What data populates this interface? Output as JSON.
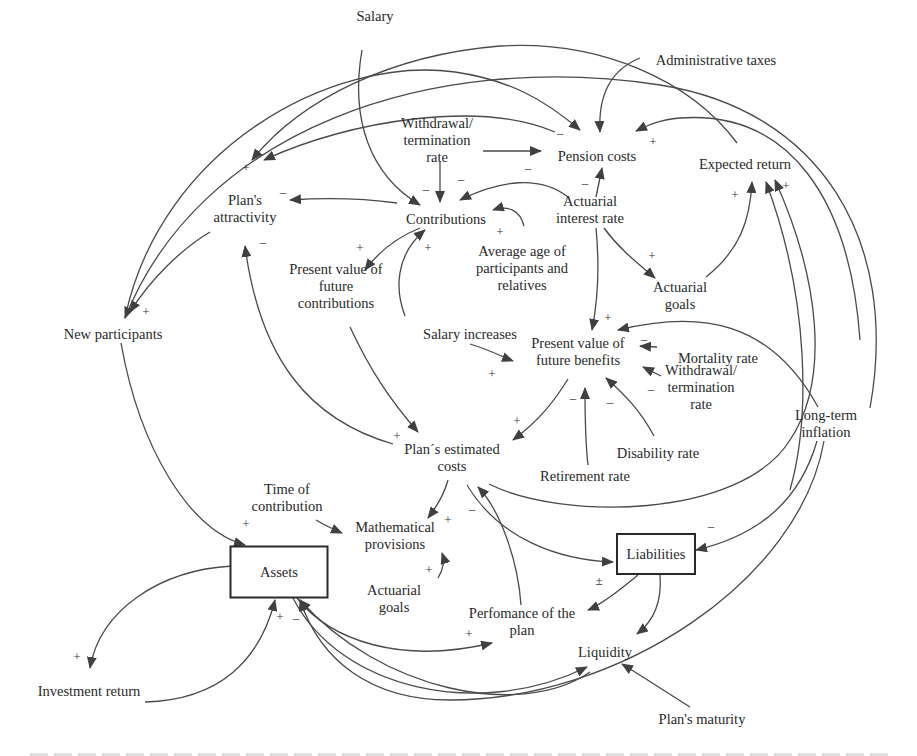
{
  "diagram": {
    "type": "causal-loop-diagram",
    "nodes": [
      {
        "id": "salary",
        "lines": [
          "Salary"
        ],
        "x": 375,
        "y": 16,
        "stock": false
      },
      {
        "id": "admin_taxes",
        "lines": [
          "Administrative taxes"
        ],
        "x": 716,
        "y": 60,
        "stock": false
      },
      {
        "id": "withdrawal_top",
        "lines": [
          "Withdrawal/",
          "termination",
          "rate"
        ],
        "x": 437,
        "y": 140,
        "stock": false
      },
      {
        "id": "pension_costs",
        "lines": [
          "Pension costs"
        ],
        "x": 597,
        "y": 156,
        "stock": false
      },
      {
        "id": "expected_return",
        "lines": [
          "Expected return"
        ],
        "x": 745,
        "y": 164,
        "stock": false
      },
      {
        "id": "plans_attractivity",
        "lines": [
          "Plan's",
          "attractivity"
        ],
        "x": 245,
        "y": 208,
        "stock": false
      },
      {
        "id": "contributions",
        "lines": [
          "Contributions"
        ],
        "x": 446,
        "y": 219,
        "stock": false
      },
      {
        "id": "actuarial_interest",
        "lines": [
          "Actuarial",
          "interest rate"
        ],
        "x": 590,
        "y": 209,
        "stock": false
      },
      {
        "id": "avg_age",
        "lines": [
          "Average age of",
          "participants and",
          "relatives"
        ],
        "x": 522,
        "y": 268,
        "stock": false
      },
      {
        "id": "actuarial_goals_top",
        "lines": [
          "Actuarial",
          "goals"
        ],
        "x": 680,
        "y": 295,
        "stock": false
      },
      {
        "id": "pv_future_contrib",
        "lines": [
          "Present value of",
          "future",
          "contributions"
        ],
        "x": 336,
        "y": 286,
        "stock": false
      },
      {
        "id": "new_participants",
        "lines": [
          "New participants"
        ],
        "x": 113,
        "y": 334,
        "stock": false
      },
      {
        "id": "salary_increases",
        "lines": [
          "Salary increases"
        ],
        "x": 470,
        "y": 334,
        "stock": false
      },
      {
        "id": "pv_future_benefits",
        "lines": [
          "Present value of",
          "future benefits"
        ],
        "x": 578,
        "y": 351,
        "stock": false
      },
      {
        "id": "mortality_rate",
        "lines": [
          "Mortality rate"
        ],
        "x": 718,
        "y": 358,
        "stock": false
      },
      {
        "id": "withdrawal_right",
        "lines": [
          "Withdrawal/",
          "termination",
          "rate"
        ],
        "x": 701,
        "y": 387,
        "stock": false
      },
      {
        "id": "long_term_inflation",
        "lines": [
          "Long-term",
          "inflation"
        ],
        "x": 826,
        "y": 423,
        "stock": false
      },
      {
        "id": "disability_rate",
        "lines": [
          "Disability rate"
        ],
        "x": 658,
        "y": 453,
        "stock": false
      },
      {
        "id": "plans_estimated_costs",
        "lines": [
          "Plan´s estimated",
          "costs"
        ],
        "x": 452,
        "y": 457,
        "stock": false
      },
      {
        "id": "retirement_rate",
        "lines": [
          "Retirement rate"
        ],
        "x": 585,
        "y": 476,
        "stock": false
      },
      {
        "id": "time_of_contribution",
        "lines": [
          "Time of",
          "contribution"
        ],
        "x": 287,
        "y": 497,
        "stock": false
      },
      {
        "id": "math_provisions",
        "lines": [
          "Mathematical",
          "provisions"
        ],
        "x": 395,
        "y": 535,
        "stock": false
      },
      {
        "id": "assets",
        "lines": [
          "Assets"
        ],
        "x": 279,
        "y": 572,
        "stock": true,
        "w": 97,
        "h": 51
      },
      {
        "id": "liabilities",
        "lines": [
          "Liabilities"
        ],
        "x": 656,
        "y": 554,
        "stock": true,
        "w": 78,
        "h": 40
      },
      {
        "id": "actuarial_goals_bottom",
        "lines": [
          "Actuarial",
          "goals"
        ],
        "x": 394,
        "y": 598,
        "stock": false
      },
      {
        "id": "performance_plan",
        "lines": [
          "Perfomance of the",
          "plan"
        ],
        "x": 522,
        "y": 621,
        "stock": false
      },
      {
        "id": "liquidity",
        "lines": [
          "Liquidity"
        ],
        "x": 605,
        "y": 652,
        "stock": false
      },
      {
        "id": "investment_return",
        "lines": [
          "Investment return"
        ],
        "x": 89,
        "y": 691,
        "stock": false
      },
      {
        "id": "plans_maturity",
        "lines": [
          "Plan's maturity"
        ],
        "x": 702,
        "y": 719,
        "stock": false
      }
    ],
    "edges": [
      {
        "from": "salary",
        "to": "contributions",
        "path": "M362 50 C350 120 370 175 420 205",
        "pol": "",
        "px": 0,
        "py": 0
      },
      {
        "from": "admin_taxes",
        "to": "pension_costs",
        "path": "M640 58 C610 70 598 95 600 132",
        "pol": "",
        "px": 0,
        "py": 0
      },
      {
        "from": "withdrawal_top",
        "to": "pension_costs",
        "path": "M483 151 L541 151",
        "pol": "–",
        "px": 528,
        "py": 172
      },
      {
        "from": "withdrawal_top",
        "to": "contributions",
        "path": "M440 162 L440 202",
        "pol": "–",
        "px": 426,
        "py": 193
      },
      {
        "from": "actuarial_interest",
        "to": "pension_costs",
        "path": "M596 197 L602 168",
        "pol": "–",
        "px": 585,
        "py": 187
      },
      {
        "from": "expected_return",
        "to": "pension_costs",
        "path": "M860 340 C850 200 790 110 680 118 C660 120 650 124 636 131",
        "pol": "+",
        "px": 653,
        "py": 146
      },
      {
        "from": "new_participants",
        "to": "pension_costs",
        "path": "M125 318 C160 150 330 55 455 72 C510 80 545 100 580 130",
        "pol": "–",
        "px": 560,
        "py": 137
      },
      {
        "from": "pension_costs",
        "to": "plans_attractivity",
        "path": "M555 132 C480 100 350 120 264 160",
        "pol": "",
        "px": 0,
        "py": 0
      },
      {
        "from": "expected_return",
        "to": "plans_attractivity",
        "path": "M737 143 C690 80 600 40 500 46 C390 55 300 100 252 160",
        "pol": "+",
        "px": 246,
        "py": 172
      },
      {
        "from": "contributions",
        "to": "plans_attractivity",
        "path": "M397 203 C360 198 320 198 290 200",
        "pol": "–",
        "px": 283,
        "py": 196
      },
      {
        "from": "actuarial_interest",
        "to": "contributions",
        "path": "M568 197 C540 175 500 180 460 200",
        "pol": "–",
        "px": 461,
        "py": 183
      },
      {
        "from": "avg_age",
        "to": "contributions",
        "path": "M524 226 C520 210 508 205 493 210",
        "pol": "+",
        "px": 500,
        "py": 236
      },
      {
        "from": "contributions",
        "to": "pv_future_contrib",
        "path": "M420 228 C400 236 380 250 365 270",
        "pol": "+",
        "px": 360,
        "py": 252
      },
      {
        "from": "salary_increases",
        "to": "contributions",
        "path": "M405 316 C395 290 395 255 425 230",
        "pol": "+",
        "px": 428,
        "py": 252
      },
      {
        "from": "plans_attractivity",
        "to": "new_participants",
        "path": "M210 232 C180 250 150 280 130 312",
        "pol": "+",
        "px": 146,
        "py": 316
      },
      {
        "from": "actuarial_interest",
        "to": "actuarial_goals_top",
        "path": "M604 228 C620 250 640 265 655 278",
        "pol": "+",
        "px": 652,
        "py": 260
      },
      {
        "from": "actuarial_interest",
        "to": "pv_future_benefits",
        "path": "M596 228 C600 270 598 300 592 330",
        "pol": "",
        "px": 0,
        "py": 0
      },
      {
        "from": "actuarial_goals_top",
        "to": "expected_return",
        "path": "M706 277 C740 250 750 220 752 182",
        "pol": "+",
        "px": 735,
        "py": 199
      },
      {
        "from": "long_term_inflation",
        "to": "expected_return",
        "path": "M790 490 C810 420 810 300 766 182",
        "pol": "+",
        "px": 786,
        "py": 190
      },
      {
        "from": "salary_increases",
        "to": "pv_future_benefits",
        "path": "M470 344 C490 350 505 358 513 361",
        "pol": "+",
        "px": 492,
        "py": 378
      },
      {
        "from": "long_term_inflation",
        "to": "pv_future_benefits",
        "path": "M818 407 C770 320 700 310 618 330",
        "pol": "+",
        "px": 608,
        "py": 322
      },
      {
        "from": "mortality_rate",
        "to": "pv_future_benefits",
        "path": "M657 347 L640 346",
        "pol": "–",
        "px": 644,
        "py": 343
      },
      {
        "from": "withdrawal_right",
        "to": "pv_future_benefits",
        "path": "M661 376 L643 367",
        "pol": "–",
        "px": 651,
        "py": 393
      },
      {
        "from": "disability_rate",
        "to": "pv_future_benefits",
        "path": "M654 436 C640 410 625 395 606 378",
        "pol": "–",
        "px": 610,
        "py": 406
      },
      {
        "from": "retirement_rate",
        "to": "pv_future_benefits",
        "path": "M588 465 C585 440 585 410 585 388",
        "pol": "–",
        "px": 573,
        "py": 402
      },
      {
        "from": "pv_future_benefits",
        "to": "plans_estimated_costs",
        "path": "M568 379 C555 400 540 420 513 440",
        "pol": "+",
        "px": 517,
        "py": 425
      },
      {
        "from": "pv_future_contrib",
        "to": "plans_estimated_costs",
        "path": "M350 327 C370 370 390 400 418 432",
        "pol": "",
        "px": 0,
        "py": 0
      },
      {
        "from": "plans_estimated_costs",
        "to": "plans_attractivity",
        "path": "M393 444 C310 420 260 360 245 246",
        "pol": "+",
        "px": 397,
        "py": 440
      },
      {
        "from": "plans_attractivity_neg",
        "to": "plans_attractivity",
        "path": "",
        "pol": "–",
        "px": 263,
        "py": 246
      },
      {
        "from": "plans_estimated_costs",
        "to": "math_provisions",
        "path": "M448 480 C444 495 438 505 428 518",
        "pol": "+",
        "px": 448,
        "py": 524
      },
      {
        "from": "time_of_contribution",
        "to": "math_provisions",
        "path": "M316 520 C326 526 335 530 342 533",
        "pol": "",
        "px": 0,
        "py": 0
      },
      {
        "from": "actuarial_goals_bottom",
        "to": "math_provisions",
        "path": "M438 578 C443 570 445 562 442 553",
        "pol": "+",
        "px": 429,
        "py": 574
      },
      {
        "from": "plans_estimated_costs",
        "to": "liabilities",
        "path": "M467 485 C500 540 560 560 613 562",
        "pol": "",
        "px": 0,
        "py": 0
      },
      {
        "from": "performance_plan",
        "to": "plans_estimated_costs",
        "path": "M521 605 C518 560 500 510 478 487",
        "pol": "–",
        "px": 472,
        "py": 513
      },
      {
        "from": "plans_estimated_costs",
        "to": "expected_return",
        "path": "M489 484 C560 520 740 520 790 440 C830 380 820 280 775 180",
        "pol": "",
        "px": 0,
        "py": 0
      },
      {
        "from": "long_term_inflation",
        "to": "liabilities",
        "path": "M817 441 C800 500 760 535 696 550",
        "pol": "–",
        "px": 711,
        "py": 530
      },
      {
        "from": "liabilities",
        "to": "performance_plan",
        "path": "M638 575 C620 590 600 605 588 610",
        "pol": "±",
        "px": 599,
        "py": 585
      },
      {
        "from": "liabilities",
        "to": "liquidity",
        "path": "M660 575 C662 600 655 620 637 634",
        "pol": "",
        "px": 0,
        "py": 0
      },
      {
        "from": "new_participants",
        "to": "assets",
        "path": "M121 343 C140 450 190 530 245 545",
        "pol": "+",
        "px": 246,
        "py": 528
      },
      {
        "from": "assets",
        "to": "investment_return",
        "path": "M232 566 C160 570 100 610 90 668",
        "pol": "+",
        "px": 77,
        "py": 661
      },
      {
        "from": "investment_return",
        "to": "assets",
        "path": "M145 702 C220 700 260 660 275 600",
        "pol": "+",
        "px": 280,
        "py": 621
      },
      {
        "from": "assets_neg",
        "to": "assets",
        "path": "",
        "pol": "–",
        "px": 296,
        "py": 622
      },
      {
        "from": "assets",
        "to": "performance_plan",
        "path": "M297 598 C330 640 400 665 492 643",
        "pol": "+",
        "px": 469,
        "py": 638
      },
      {
        "from": "liquidity_loop",
        "to": "assets",
        "path": "M590 672 C520 720 380 690 300 600",
        "pol": "",
        "px": 0,
        "py": 0
      },
      {
        "from": "assets",
        "to": "liquidity",
        "path": "M293 598 C340 690 480 720 587 667",
        "pol": "",
        "px": 0,
        "py": 0
      },
      {
        "from": "long_term_inflation",
        "to": "assets",
        "path": "M824 441 C800 580 620 700 450 700 C370 700 320 660 300 600",
        "pol": "",
        "px": 0,
        "py": 0
      },
      {
        "from": "plans_maturity",
        "to": "liquidity",
        "path": "M690 707 C660 688 640 675 622 664",
        "pol": "",
        "px": 0,
        "py": 0
      },
      {
        "from": "expected_return_outer",
        "to": "new_participants",
        "path": "M870 408 C900 240 820 110 660 85 C430 50 200 130 125 318",
        "pol": "",
        "px": 0,
        "py": 0
      }
    ]
  },
  "caption": {
    "text": ""
  }
}
